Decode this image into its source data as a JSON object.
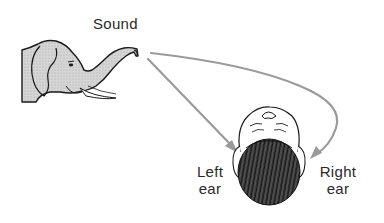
{
  "diagram": {
    "source_label": "Sound",
    "labels": {
      "left_ear_line1": "Left",
      "left_ear_line2": "ear",
      "right_ear_line1": "Right",
      "right_ear_line2": "ear"
    },
    "elements": {
      "source": "elephant-trumpeting",
      "receiver": "human-head-top-view"
    },
    "arrows": [
      {
        "from": "elephant trunk",
        "to": "Left ear",
        "shape": "straight"
      },
      {
        "from": "elephant trunk",
        "to": "Right ear",
        "shape": "curved around head"
      }
    ],
    "colors": {
      "arrow": "#9a9a9a",
      "outline": "#1a1a1a",
      "elephant_fill": "#cfcfcf",
      "hair": "#2b2b2b",
      "text": "#2a2a2a"
    }
  }
}
